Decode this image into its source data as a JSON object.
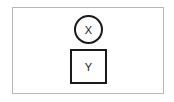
{
  "diagram": {
    "nodes": [
      {
        "id": "X",
        "label": "X",
        "shape": "circle"
      },
      {
        "id": "Y",
        "label": "Y",
        "shape": "square"
      }
    ],
    "edges": [],
    "colors": {
      "stroke": "#1a1a1a",
      "frame": "#b8b8b8",
      "background": "#ffffff"
    }
  }
}
